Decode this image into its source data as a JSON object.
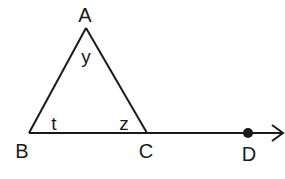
{
  "diagram": {
    "type": "geometry",
    "vertices": {
      "A": {
        "label": "A",
        "x": 86,
        "y": 28
      },
      "B": {
        "label": "B",
        "x": 29,
        "y": 133
      },
      "C": {
        "label": "C",
        "x": 147,
        "y": 133
      }
    },
    "point_D": {
      "label": "D",
      "x": 248,
      "y": 133
    },
    "angles": {
      "at_A": "y",
      "at_B": "t",
      "at_C": "z"
    },
    "ray_end": {
      "x": 283,
      "y": 133
    },
    "stroke_color": "#1a1a1a",
    "background": "#ffffff"
  }
}
